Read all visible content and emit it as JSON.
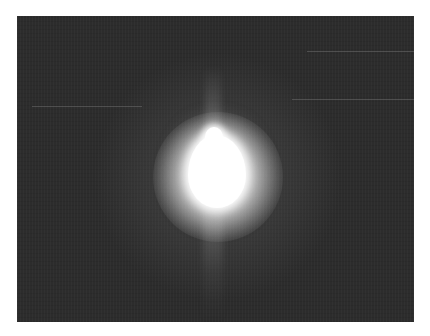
{
  "image": {
    "description": "Bright overexposed light source with radial glare on a dark gray background",
    "background_color": "#2c2c2c",
    "frame_color": "#ffffff",
    "core_color": "#ffffff",
    "alt_text": "Bright light source with glare"
  }
}
